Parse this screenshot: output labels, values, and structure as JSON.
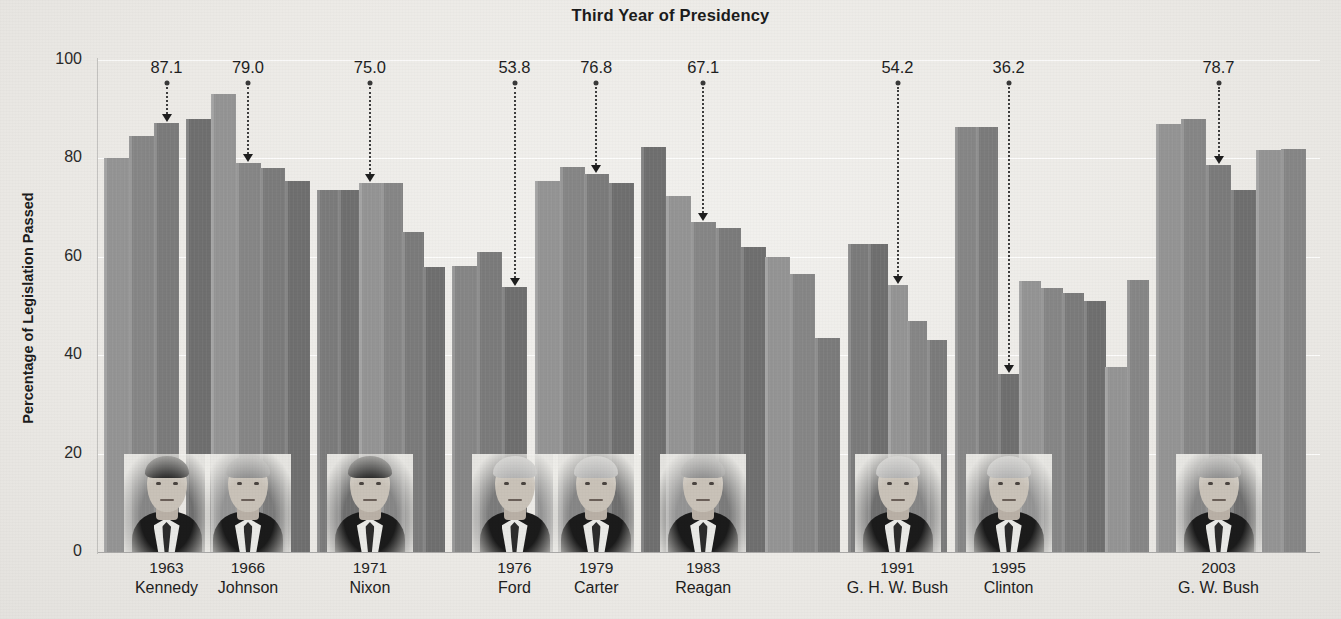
{
  "chart_data": {
    "type": "bar",
    "title": "Third Year of Presidency",
    "xlabel": "",
    "ylabel": "Percentage of Legislation Passed",
    "ylim": [
      0,
      100
    ],
    "yticks": [
      0,
      20,
      40,
      60,
      80,
      100
    ],
    "ytick_labels": [
      "0",
      "20",
      "40",
      "60",
      "80",
      "100"
    ],
    "grid": true,
    "legend": "none",
    "value_suffix": "%",
    "note": "Each group is one presidency; one bar per year in office. The labeled bar is the president's third year in office.",
    "groups": [
      {
        "president": "Kennedy",
        "year_label": "1963",
        "highlight_value": 87.1,
        "highlight_index": 2,
        "values": [
          80.0,
          84.5,
          87.1
        ]
      },
      {
        "president": "Johnson",
        "year_label": "1966",
        "highlight_value": 79.0,
        "highlight_index": 2,
        "values": [
          88.0,
          93.0,
          79.0,
          78.0,
          75.5
        ]
      },
      {
        "president": "Nixon",
        "year_label": "1971",
        "highlight_value": 75.0,
        "highlight_index": 2,
        "values": [
          73.5,
          73.5,
          75.0,
          75.0,
          65.0,
          58.0
        ]
      },
      {
        "president": "Ford",
        "year_label": "1976",
        "highlight_value": 53.8,
        "highlight_index": 2,
        "values": [
          58.2,
          61.0,
          53.8
        ]
      },
      {
        "president": "Carter",
        "year_label": "1979",
        "highlight_value": 76.8,
        "highlight_index": 2,
        "values": [
          75.4,
          78.3,
          76.8,
          75.1
        ]
      },
      {
        "president": "Reagan",
        "year_label": "1983",
        "highlight_value": 67.1,
        "highlight_index": 2,
        "values": [
          82.4,
          72.4,
          67.1,
          65.8,
          62.0,
          59.9,
          56.5,
          43.5
        ]
      },
      {
        "president": "G. H. W. Bush",
        "year_label": "1991",
        "highlight_value": 54.2,
        "highlight_index": 2,
        "values": [
          62.6,
          62.6,
          54.2,
          47.0,
          43.0
        ]
      },
      {
        "president": "Clinton",
        "year_label": "1995",
        "highlight_value": 36.2,
        "highlight_index": 2,
        "values": [
          86.4,
          86.4,
          36.2,
          55.1,
          53.6,
          52.6,
          51.0,
          37.6,
          55.3
        ]
      },
      {
        "president": "G. W. Bush",
        "year_label": "2003",
        "highlight_value": 78.7,
        "highlight_index": 2,
        "values": [
          87.0,
          88.0,
          78.7,
          73.5,
          81.8,
          82.0
        ]
      }
    ]
  },
  "colors": {
    "background": "#eeedea",
    "bar": "#8e8e8e",
    "gridline": "#ffffff",
    "text": "#1c1c1c",
    "callout": "#1e1e1e"
  }
}
